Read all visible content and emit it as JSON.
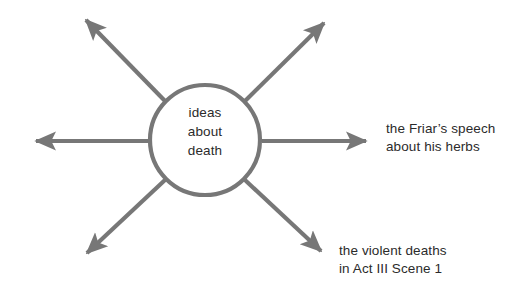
{
  "diagram": {
    "type": "spider-diagram",
    "background_color": "#ffffff",
    "stroke_color": "#777777",
    "text_color": "#2b2b2b",
    "center_node": {
      "shape": "circle",
      "lines": [
        "ideas",
        "about",
        "death"
      ],
      "line1": "ideas",
      "line2": "about",
      "line3": "death",
      "center_x": 205,
      "center_y": 140,
      "radius": 57
    },
    "branches": [
      {
        "direction": "left",
        "label": ""
      },
      {
        "direction": "upper-left",
        "label": ""
      },
      {
        "direction": "upper-right",
        "label": ""
      },
      {
        "direction": "right",
        "label": "the Friar's speech about his herbs"
      },
      {
        "direction": "lower-right",
        "label": "the violent deaths in Act III Scene 1"
      },
      {
        "direction": "lower-left",
        "label": ""
      }
    ],
    "labels": {
      "friar": {
        "line1": "the Friar’s speech",
        "line2": "about his herbs"
      },
      "violent": {
        "line1": "the violent deaths",
        "line2": "in Act III Scene 1"
      }
    }
  }
}
